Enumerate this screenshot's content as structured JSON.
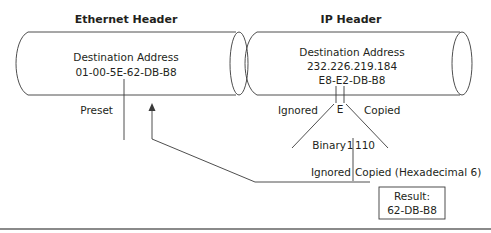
{
  "ethernet": {
    "title": "Ethernet Header",
    "field_label": "Destination Address",
    "mac": "01-00-5E-62-DB-B8",
    "preset_label": "Preset"
  },
  "ip": {
    "title": "IP Header",
    "field_label": "Destination Address",
    "ip_address": "232.226.219.184",
    "hex": "E8-E2-DB-B8",
    "nibble": "E",
    "ignored_label": "Ignored",
    "copied_label": "Copied"
  },
  "binary": {
    "prefix": "Binary",
    "bit_left": "1",
    "bits_right": "110",
    "ignored_label": "Ignored",
    "copied_label": "Copied (Hexadecimal 6)"
  },
  "result": {
    "label": "Result:",
    "value": "62-DB-B8"
  },
  "colors": {
    "line": "#3a3a3a",
    "text": "#231f20",
    "background": "#ffffff"
  }
}
